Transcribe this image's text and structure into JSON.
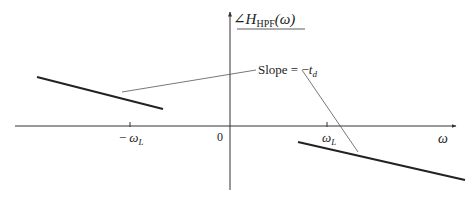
{
  "diagram": {
    "type": "phase-response-plot",
    "y_axis_label": {
      "angle_symbol": "∠",
      "function": "H",
      "subscript": "HPF",
      "argument": "(ω)"
    },
    "x_axis_label": "ω",
    "origin_label": "0",
    "ticks": [
      {
        "label_sign": "−",
        "label_symbol": "ω",
        "label_sub": "L"
      },
      {
        "label_sign": "",
        "label_symbol": "ω",
        "label_sub": "L"
      }
    ],
    "annotation": {
      "text_prefix": "Slope = −",
      "text_symbol": "t",
      "text_sub": "d"
    },
    "colors": {
      "axis": "#333333",
      "segment": "#222222",
      "pointer": "#555555",
      "background": "#ffffff"
    }
  }
}
